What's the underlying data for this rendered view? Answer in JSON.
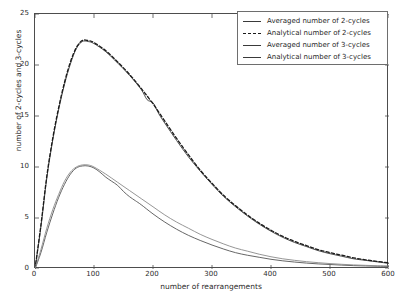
{
  "chart_data": {
    "type": "line",
    "title": "",
    "xlabel": "number of rearrangements",
    "ylabel": "number of 2-cycles and 3-cycles",
    "xlim": [
      0,
      600
    ],
    "ylim": [
      0,
      25
    ],
    "xticks": [
      0,
      100,
      200,
      300,
      400,
      500,
      600
    ],
    "yticks": [
      0,
      5,
      10,
      15,
      20,
      25
    ],
    "grid": false,
    "legend_position": "upper right",
    "series": [
      {
        "name": "Averaged number of 2-cycles",
        "style": "solid",
        "color": "#3a3a3a",
        "x": [
          0,
          10,
          20,
          30,
          40,
          50,
          60,
          70,
          80,
          90,
          100,
          120,
          140,
          160,
          180,
          190,
          200,
          210,
          220,
          240,
          260,
          280,
          300,
          320,
          340,
          360,
          380,
          400,
          420,
          440,
          460,
          480,
          500,
          520,
          540,
          560,
          580,
          600
        ],
        "y": [
          0.0,
          4.1,
          8.9,
          12.6,
          15.6,
          18.1,
          20.1,
          21.6,
          22.3,
          22.3,
          22.1,
          21.3,
          20.2,
          19.0,
          17.6,
          16.6,
          16.3,
          15.2,
          14.3,
          12.6,
          11.0,
          9.6,
          8.3,
          7.1,
          6.1,
          5.2,
          4.4,
          3.7,
          3.1,
          2.6,
          2.2,
          1.8,
          1.5,
          1.25,
          1.0,
          0.85,
          0.7,
          0.55
        ]
      },
      {
        "name": "Analytical number of 2-cycles",
        "style": "dashed",
        "color": "#1a1a1a",
        "x": [
          0,
          10,
          20,
          30,
          40,
          50,
          60,
          70,
          80,
          90,
          100,
          120,
          140,
          160,
          180,
          200,
          220,
          240,
          260,
          280,
          300,
          320,
          340,
          360,
          380,
          400,
          420,
          440,
          460,
          480,
          500,
          520,
          540,
          560,
          580,
          600
        ],
        "y": [
          0.0,
          4.3,
          9.1,
          12.8,
          15.8,
          18.3,
          20.3,
          21.7,
          22.4,
          22.4,
          22.2,
          21.4,
          20.3,
          19.1,
          17.7,
          16.2,
          14.5,
          12.8,
          11.2,
          9.7,
          8.4,
          7.2,
          6.2,
          5.3,
          4.5,
          3.8,
          3.2,
          2.7,
          2.3,
          1.9,
          1.6,
          1.35,
          1.1,
          0.9,
          0.75,
          0.6
        ]
      },
      {
        "name": "Averaged number of 3-cycles",
        "style": "solid",
        "color": "#555555",
        "x": [
          0,
          10,
          20,
          30,
          40,
          50,
          60,
          70,
          80,
          90,
          100,
          110,
          120,
          130,
          140,
          150,
          160,
          170,
          180,
          200,
          220,
          240,
          260,
          280,
          300,
          320,
          340,
          360,
          380,
          400,
          420,
          440,
          460,
          480,
          500,
          520,
          540,
          560,
          580,
          600
        ],
        "y": [
          0.0,
          1.6,
          3.6,
          5.4,
          7.0,
          8.3,
          9.3,
          9.9,
          10.1,
          10.1,
          9.9,
          9.5,
          9.0,
          8.6,
          8.2,
          7.6,
          7.1,
          6.7,
          6.3,
          5.4,
          4.6,
          3.9,
          3.3,
          2.8,
          2.35,
          1.95,
          1.6,
          1.35,
          1.15,
          0.95,
          0.8,
          0.68,
          0.58,
          0.5,
          0.44,
          0.38,
          0.33,
          0.3,
          0.27,
          0.25
        ]
      },
      {
        "name": "Analytical number of 3-cycles",
        "style": "solid",
        "color": "#8a8a8a",
        "x": [
          0,
          10,
          20,
          30,
          40,
          50,
          60,
          70,
          80,
          90,
          100,
          120,
          140,
          160,
          180,
          200,
          220,
          240,
          260,
          280,
          300,
          320,
          340,
          360,
          380,
          400,
          420,
          440,
          460,
          480,
          500,
          520,
          540,
          560,
          580,
          600
        ],
        "y": [
          0.0,
          1.9,
          4.0,
          5.8,
          7.3,
          8.6,
          9.5,
          10.0,
          10.2,
          10.2,
          10.0,
          9.3,
          8.5,
          7.7,
          6.9,
          6.1,
          5.3,
          4.6,
          4.0,
          3.4,
          2.9,
          2.45,
          2.05,
          1.75,
          1.45,
          1.2,
          1.0,
          0.85,
          0.72,
          0.62,
          0.53,
          0.46,
          0.4,
          0.36,
          0.32,
          0.3
        ]
      }
    ]
  },
  "legend": {
    "items": [
      {
        "label": "Averaged number of 2-cycles",
        "style": "solid"
      },
      {
        "label": "Analytical number of 2-cycles",
        "style": "dashed"
      },
      {
        "label": "Averaged number of 3-cycles",
        "style": "solid"
      },
      {
        "label": "Analytical number of 3-cycles",
        "style": "solid"
      }
    ]
  },
  "axes": {
    "xlabel": "number of rearrangements",
    "ylabel": "number of 2-cycles and 3-cycles",
    "xticks": [
      "0",
      "100",
      "200",
      "300",
      "400",
      "500",
      "600"
    ],
    "yticks": [
      "0",
      "5",
      "10",
      "15",
      "20",
      "25"
    ]
  }
}
